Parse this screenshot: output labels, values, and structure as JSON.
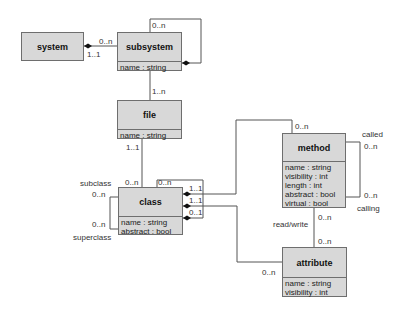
{
  "diagram": {
    "type": "UML class diagram",
    "classes": {
      "system": {
        "name": "system",
        "attributes": []
      },
      "subsystem": {
        "name": "subsystem",
        "attributes": [
          "name : string"
        ]
      },
      "file": {
        "name": "file",
        "attributes": [
          "name : string"
        ]
      },
      "class": {
        "name": "class",
        "attributes": [
          "name : string",
          "abstract : bool"
        ]
      },
      "method": {
        "name": "method",
        "attributes": [
          "name : string",
          "visibility : int",
          "length : int",
          "abstract : bool",
          "virtual : bool"
        ]
      },
      "attribute": {
        "name": "attribute",
        "attributes": [
          "name : string",
          "visibility : int"
        ]
      }
    },
    "labels": {
      "system_subsystem_near_subsystem": "0..n",
      "system_subsystem_near_system": "1..1",
      "subsystem_self": "0..n",
      "subsystem_file": "1..n",
      "file_class": "1..1",
      "class_file_side": "0..n",
      "class_self_top": "0..n",
      "subclass_role": "subclass",
      "subclass_mult": "0..n",
      "superclass_mult": "0..n",
      "superclass_role": "superclass",
      "class_method_mult": "1..1",
      "class_attribute_mult": "1..1",
      "class_self_mult": "0..1",
      "method_class_mult": "0..n",
      "called_role": "called",
      "called_mult": "0..n",
      "calling_mult": "0..n",
      "calling_role": "calling",
      "method_rw_mult": "0..n",
      "read_write": "read/write",
      "attribute_rw_mult": "0..n",
      "attribute_class_mult": "0..n"
    }
  }
}
